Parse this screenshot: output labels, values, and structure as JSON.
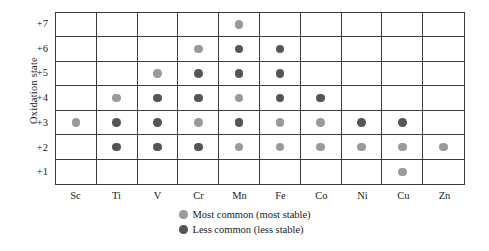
{
  "chart_data": {
    "type": "heatmap",
    "title": "",
    "xlabel": "",
    "ylabel": "Oxidation state",
    "grid": true,
    "legend_position": "bottom-center",
    "categories": [
      "Sc",
      "Ti",
      "V",
      "Cr",
      "Mn",
      "Fe",
      "Co",
      "Ni",
      "Cu",
      "Zn"
    ],
    "oxidation_states": [
      "+7",
      "+6",
      "+5",
      "+4",
      "+3",
      "+2",
      "+1"
    ],
    "ylim": [
      1,
      7
    ],
    "marker_legend": [
      {
        "key": "most",
        "label": "Most common (most stable)",
        "color": "#9a9a9a"
      },
      {
        "key": "less",
        "label": "Less common (less stable)",
        "color": "#555555"
      }
    ],
    "cells": {
      "Sc": {
        "+7": null,
        "+6": null,
        "+5": null,
        "+4": null,
        "+3": "most",
        "+2": null,
        "+1": null
      },
      "Ti": {
        "+7": null,
        "+6": null,
        "+5": null,
        "+4": "most",
        "+3": "less",
        "+2": "less",
        "+1": null
      },
      "V": {
        "+7": null,
        "+6": null,
        "+5": "most",
        "+4": "less",
        "+3": "less",
        "+2": "less",
        "+1": null
      },
      "Cr": {
        "+7": null,
        "+6": "most",
        "+5": "less",
        "+4": "less",
        "+3": "most",
        "+2": "less",
        "+1": null
      },
      "Mn": {
        "+7": "most",
        "+6": "less",
        "+5": "less",
        "+4": "most",
        "+3": "less",
        "+2": "most",
        "+1": null
      },
      "Fe": {
        "+7": null,
        "+6": "less",
        "+5": "less",
        "+4": "less",
        "+3": "most",
        "+2": "most",
        "+1": null
      },
      "Co": {
        "+7": null,
        "+6": null,
        "+5": null,
        "+4": "less",
        "+3": "most",
        "+2": "most",
        "+1": null
      },
      "Ni": {
        "+7": null,
        "+6": null,
        "+5": null,
        "+4": null,
        "+3": "less",
        "+2": "most",
        "+1": null
      },
      "Cu": {
        "+7": null,
        "+6": null,
        "+5": null,
        "+4": null,
        "+3": "less",
        "+2": "most",
        "+1": "most"
      },
      "Zn": {
        "+7": null,
        "+6": null,
        "+5": null,
        "+4": null,
        "+3": null,
        "+2": "most",
        "+1": null
      }
    }
  },
  "axis": {
    "y_title": "Oxidation state",
    "y_ticks": [
      "+7",
      "+6",
      "+5",
      "+4",
      "+3",
      "+2",
      "+1"
    ],
    "x_ticks": [
      "Sc",
      "Ti",
      "V",
      "Cr",
      "Mn",
      "Fe",
      "Co",
      "Ni",
      "Cu",
      "Zn"
    ]
  },
  "legend": {
    "items": [
      {
        "label": "Most common (most stable)"
      },
      {
        "label": "Less common (less stable)"
      }
    ]
  }
}
